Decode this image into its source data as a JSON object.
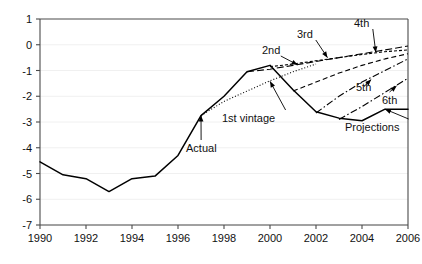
{
  "chart_data": {
    "type": "line",
    "title": "",
    "subtitle": "",
    "xlabel": "",
    "ylabel": "",
    "xlim": [
      1990,
      2006
    ],
    "ylim": [
      -7,
      1
    ],
    "grid": true,
    "legend_position": "inline-annotations",
    "xticks": [
      "1990",
      "1992",
      "1994",
      "1996",
      "1998",
      "2000",
      "2002",
      "2004",
      "2006"
    ],
    "xtick_values": [
      1990,
      1992,
      1994,
      1996,
      1998,
      2000,
      2002,
      2004,
      2006
    ],
    "yticks": [
      "1",
      "0",
      "-1",
      "-2",
      "-3",
      "-4",
      "-5",
      "-6",
      "-7"
    ],
    "ytick_values": [
      1,
      0,
      -1,
      -2,
      -3,
      -4,
      -5,
      -6,
      -7
    ],
    "series": [
      {
        "name": "Actual",
        "style": "solid",
        "x": [
          1990,
          1991,
          1992,
          1993,
          1994,
          1995,
          1996,
          1997,
          1998,
          1999,
          2000,
          2001,
          2002,
          2003,
          2004,
          2005,
          2006
        ],
        "values": [
          -4.55,
          -5.05,
          -5.2,
          -5.7,
          -5.2,
          -5.1,
          -4.3,
          -2.75,
          -2.0,
          -1.05,
          -0.8,
          -1.75,
          -2.6,
          -2.85,
          -2.95,
          -2.5,
          -2.5
        ]
      },
      {
        "name": "1st vintage",
        "style": "dotted",
        "x": [
          1997,
          1998,
          1999,
          2000,
          2001,
          2002
        ],
        "values": [
          -2.75,
          -2.2,
          -1.8,
          -1.4,
          -1.05,
          -0.75
        ]
      },
      {
        "name": "2nd",
        "style": "dashed-long",
        "x": [
          1999,
          2000,
          2001,
          2002,
          2003,
          2004,
          2005,
          2006
        ],
        "values": [
          -1.05,
          -0.95,
          -0.8,
          -0.65,
          -0.5,
          -0.35,
          -0.2,
          -0.05
        ]
      },
      {
        "name": "3rd",
        "style": "dashed-fine",
        "x": [
          2000,
          2001,
          2002,
          2003,
          2004,
          2005,
          2006
        ],
        "values": [
          -0.85,
          -0.75,
          -0.62,
          -0.5,
          -0.38,
          -0.27,
          -0.2
        ]
      },
      {
        "name": "4th",
        "style": "dashed",
        "x": [
          2001,
          2002,
          2003,
          2004,
          2005,
          2006
        ],
        "values": [
          -1.8,
          -1.45,
          -1.1,
          -0.8,
          -0.55,
          -0.35
        ]
      },
      {
        "name": "5th",
        "style": "dash-dot",
        "x": [
          2002,
          2003,
          2004,
          2005,
          2006
        ],
        "values": [
          -2.65,
          -2.0,
          -1.45,
          -1.0,
          -0.55
        ]
      },
      {
        "name": "6th",
        "style": "dash-dot",
        "x": [
          2003,
          2004,
          2005,
          2006
        ],
        "values": [
          -2.9,
          -2.4,
          -1.85,
          -1.3
        ]
      }
    ],
    "annotations": [
      {
        "label": "Actual",
        "points_to": [
          1997.0,
          -2.75
        ]
      },
      {
        "label": "1st vintage",
        "points_to": [
          2000.0,
          -1.42
        ]
      },
      {
        "label": "2nd",
        "points_to": [
          2001.2,
          -0.78
        ]
      },
      {
        "label": "3rd",
        "points_to": [
          2002.5,
          -0.5
        ]
      },
      {
        "label": "4th",
        "points_to": [
          2004.6,
          -0.3
        ]
      },
      {
        "label": "5th",
        "points_to": [
          2004.4,
          -1.35
        ]
      },
      {
        "label": "6th",
        "points_to": [
          2005.5,
          -1.6
        ]
      },
      {
        "label": "Projections",
        "points_to": [
          2005.0,
          -2.5
        ]
      }
    ]
  },
  "colors": {
    "axis": "#4a4a4a",
    "grid": "#f0f0f0",
    "series": "#000000",
    "text": "#111111",
    "background": "#ffffff"
  }
}
